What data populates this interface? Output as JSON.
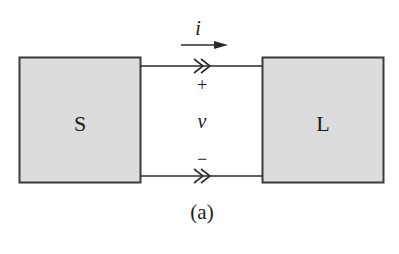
{
  "diagram": {
    "type": "two-port source-load connection",
    "blocks": [
      {
        "id": "source",
        "label": "S",
        "fill": "#dcdcdc",
        "stroke": "#3a3a3a"
      },
      {
        "id": "load",
        "label": "L",
        "fill": "#dcdcdc",
        "stroke": "#3a3a3a"
      }
    ],
    "current": {
      "symbol": "i",
      "direction": "right"
    },
    "voltage": {
      "symbol": "v",
      "plus": "+",
      "minus": "−"
    },
    "caption": "(a)"
  },
  "colors": {
    "block_fill": "#dcdcdc",
    "line": "#2a2a2a",
    "background": "#ffffff"
  }
}
